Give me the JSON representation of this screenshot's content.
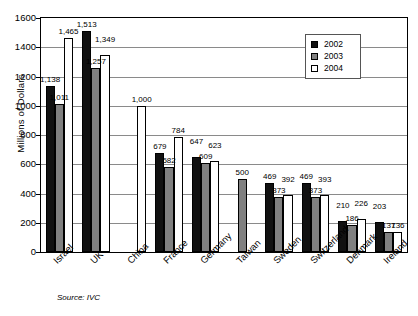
{
  "chart_data": {
    "type": "bar",
    "title": "",
    "subtitle": "",
    "xlabel": "",
    "ylabel": "Millions of Dollars",
    "ylim": [
      0,
      1600
    ],
    "ytick_step": 200,
    "yticks": [
      1600,
      1400,
      1200,
      1000,
      800,
      600,
      400,
      200,
      0
    ],
    "ytick_labels": [
      "1600",
      "1400",
      "1200",
      "1000",
      "800",
      "600",
      "400",
      "200",
      "0"
    ],
    "grid": true,
    "grid_axis": "y",
    "legend_position": "top-right",
    "categories": [
      "Israel",
      "UK",
      "China",
      "France",
      "Germany",
      "Taiwan",
      "Sweden",
      "Switzerland",
      "Denmark",
      "Ireland"
    ],
    "series": [
      {
        "name": "2002",
        "color": "#111111",
        "values": [
          1138,
          1513,
          null,
          679,
          647,
          null,
          469,
          469,
          210,
          203
        ],
        "labels": [
          "1,138",
          "1,513",
          "",
          "679",
          "647",
          "",
          "469",
          "469",
          "210",
          "203"
        ]
      },
      {
        "name": "2003",
        "color": "#808080",
        "values": [
          1011,
          1257,
          null,
          582,
          609,
          500,
          373,
          373,
          186,
          137
        ],
        "labels": [
          "1,011",
          "1,257",
          "",
          "582",
          "609",
          "500",
          "373",
          "373",
          "186",
          "137"
        ]
      },
      {
        "name": "2004",
        "color": "#ffffff",
        "values": [
          1465,
          1349,
          1000,
          784,
          623,
          null,
          392,
          393,
          226,
          136
        ],
        "labels": [
          "1,465",
          "1,349",
          "1,000",
          "784",
          "623",
          "",
          "392",
          "393",
          "226",
          "136"
        ]
      }
    ],
    "annotations": [
      "Source: IVC"
    ]
  },
  "legend": {
    "items": [
      {
        "label": "2002",
        "swatch": "black-square-swatch"
      },
      {
        "label": "2003",
        "swatch": "gray-square-swatch"
      },
      {
        "label": "2004",
        "swatch": "white-square-swatch"
      }
    ]
  },
  "axis": {
    "y_title": "Millions of Dollars",
    "y_tick_labels": [
      "1600",
      "1400",
      "1200",
      "1000",
      "800",
      "600",
      "400",
      "200",
      "0"
    ],
    "x_tick_labels": [
      "Israel",
      "UK",
      "China",
      "France",
      "Germany",
      "Taiwan",
      "Sweden",
      "Switzerland",
      "Denmark",
      "Ireland"
    ]
  },
  "footer": {
    "source": "Source: IVC"
  }
}
